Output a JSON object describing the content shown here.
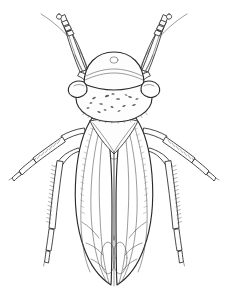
{
  "figure": {
    "domain": "Natural-Image",
    "subject_name": "leafhopper",
    "view": "dorsal",
    "style": "pen-and-ink scientific line drawing",
    "caption": "",
    "canvas": {
      "width": 228,
      "height": 294
    },
    "colors": {
      "background": "#ffffff",
      "ink": "#2b2b2b",
      "ink_light": "#4a4a4a",
      "hair": "#555555",
      "shade": "#7d7d7d",
      "body_fill": "#fdfdfd",
      "wing_fill": "#ffffff",
      "stipple": "#5a5a5a"
    },
    "parts": [
      {
        "id": "crown",
        "label": "crown (vertex)",
        "note": "rounded plate at top of head with small median ocellus mark"
      },
      {
        "id": "ocellus",
        "label": "median ocellus mark",
        "note": "small circle near top center of crown"
      },
      {
        "id": "eye-left",
        "label": "left compound eye",
        "note": "rounded lobe at side of head"
      },
      {
        "id": "eye-right",
        "label": "right compound eye",
        "note": "rounded lobe at side of head"
      },
      {
        "id": "pronotum",
        "label": "pronotum",
        "note": "broad oval thoracic plate bearing scattered stipple marks"
      },
      {
        "id": "scutellum",
        "label": "scutellum",
        "note": "downward pointing triangle behind pronotum"
      },
      {
        "id": "forewing-left",
        "label": "left forewing (tegmen)",
        "note": "elongate wing with longitudinal veins and apical cells"
      },
      {
        "id": "forewing-right",
        "label": "right forewing (tegmen)",
        "note": "elongate wing with longitudinal veins and apical cells"
      },
      {
        "id": "foreleg-left",
        "label": "left foreleg",
        "note": "raised forward, femur tibia and tarsus"
      },
      {
        "id": "foreleg-right",
        "label": "right foreleg",
        "note": "raised forward, femur tibia and tarsus"
      },
      {
        "id": "antenna-left",
        "label": "left antenna",
        "note": "fine bristle sweeping outward and upward"
      },
      {
        "id": "antenna-right",
        "label": "right antenna",
        "note": "fine bristle sweeping outward and upward"
      },
      {
        "id": "midleg-left",
        "label": "left midleg",
        "note": "angled outward and downward, spinose tibia"
      },
      {
        "id": "midleg-right",
        "label": "right midleg",
        "note": "angled outward and downward, spinose tibia"
      },
      {
        "id": "hindleg-left",
        "label": "left hindleg",
        "note": "long spinose tibia with dense bristle row and segmented tarsus"
      },
      {
        "id": "hindleg-right",
        "label": "right hindleg",
        "note": "long spinose tibia with dense bristle row and segmented tarsus"
      },
      {
        "id": "wing-apex",
        "label": "wing apex cells",
        "note": "paired oval apical cells where the wings overlap"
      }
    ],
    "counts": {
      "legs": 6,
      "antennae": 2,
      "forewings": 2,
      "eyes": 2
    },
    "stipple_marks": [
      {
        "x": 94,
        "y": 98,
        "r": 1.5
      },
      {
        "x": 101,
        "y": 104,
        "r": 1.3
      },
      {
        "x": 107,
        "y": 96,
        "r": 1.6
      },
      {
        "x": 112,
        "y": 107,
        "r": 1.2
      },
      {
        "x": 118,
        "y": 99,
        "r": 1.5
      },
      {
        "x": 124,
        "y": 106,
        "r": 1.3
      },
      {
        "x": 130,
        "y": 97,
        "r": 1.4
      },
      {
        "x": 88,
        "y": 108,
        "r": 1.2
      },
      {
        "x": 99,
        "y": 112,
        "r": 1.3
      },
      {
        "x": 113,
        "y": 94,
        "r": 1.2
      },
      {
        "x": 134,
        "y": 105,
        "r": 1.4
      },
      {
        "x": 126,
        "y": 95,
        "r": 1.1
      },
      {
        "x": 91,
        "y": 103,
        "r": 1.1
      },
      {
        "x": 119,
        "y": 111,
        "r": 1.2
      },
      {
        "x": 105,
        "y": 110,
        "r": 1.1
      },
      {
        "x": 137,
        "y": 99,
        "r": 1.2
      }
    ]
  }
}
